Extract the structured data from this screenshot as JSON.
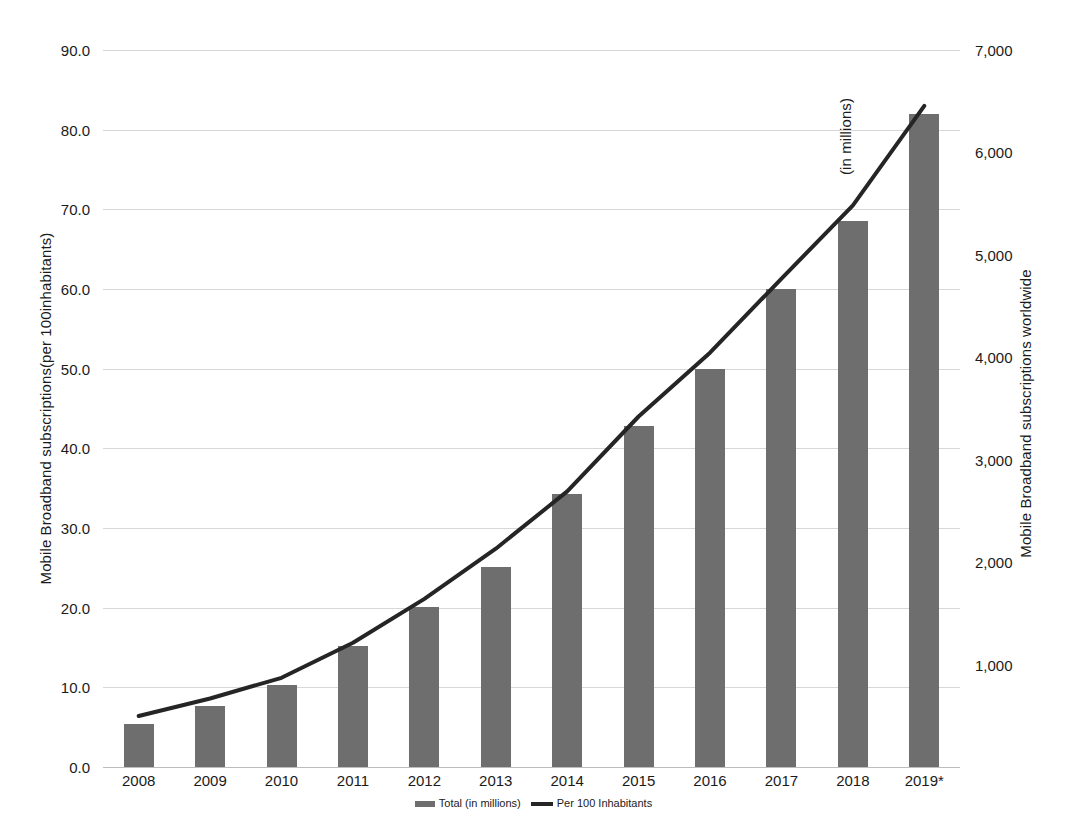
{
  "chart_data": {
    "type": "bar",
    "title": "",
    "subtitle": "",
    "categories": [
      "2008",
      "2009",
      "2010",
      "2011",
      "2012",
      "2013",
      "2014",
      "2015",
      "2016",
      "2017",
      "2018",
      "2019*"
    ],
    "xlabel": "",
    "grid": true,
    "legend_position": "bottom",
    "axes": {
      "left": {
        "label": "Mobile Broadband subscriptions(per 100inhabitants)",
        "ticks": [
          "0.0",
          "10.0",
          "20.0",
          "30.0",
          "40.0",
          "50.0",
          "60.0",
          "70.0",
          "80.0",
          "90.0"
        ],
        "tick_values": [
          0,
          10,
          20,
          30,
          40,
          50,
          60,
          70,
          80,
          90
        ],
        "ylim": [
          0,
          90
        ]
      },
      "right": {
        "label_line1": "Mobile Broadband subscriptions worldwide",
        "label_line2": "(in millions)",
        "ticks": [
          "1,000",
          "2,000",
          "3,000",
          "4,000",
          "5,000",
          "6,000",
          "7,000"
        ],
        "tick_values": [
          1000,
          2000,
          3000,
          4000,
          5000,
          6000,
          7000
        ],
        "ylim": [
          0,
          7000
        ]
      }
    },
    "series": [
      {
        "name": "Total (in millions)",
        "kind": "bar",
        "axis": "right",
        "color": "#6e6e6e",
        "values": [
          420,
          600,
          800,
          1180,
          1560,
          1950,
          2670,
          3330,
          3890,
          4670,
          5330,
          6380
        ]
      },
      {
        "name": "Per 100 Inhabitants",
        "kind": "line",
        "axis": "left",
        "color": "#252525",
        "values": [
          6.4,
          8.6,
          11.2,
          15.6,
          21.1,
          27.4,
          34.6,
          44.0,
          52.0,
          61.3,
          70.5,
          83.0
        ]
      }
    ],
    "legend": [
      {
        "label": "Total (in millions)",
        "marker": "bar-swatch",
        "color": "#6e6e6e"
      },
      {
        "label": "Per 100 Inhabitants",
        "marker": "line-swatch",
        "color": "#252525"
      }
    ]
  }
}
